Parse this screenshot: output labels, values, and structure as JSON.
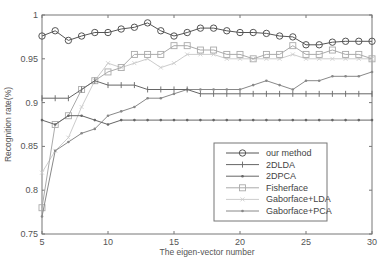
{
  "chart_data": {
    "type": "line",
    "title": "",
    "xlabel": "The eigen-vector number",
    "ylabel": "Recognition rate(%)",
    "xlim": [
      5,
      30
    ],
    "ylim": [
      0.75,
      1.0
    ],
    "xticks": [
      5,
      10,
      15,
      20,
      25,
      30
    ],
    "yticks": [
      0.75,
      0.8,
      0.85,
      0.9,
      0.95,
      1
    ],
    "ytick_labels": [
      "0.75",
      "0.8",
      "0.85",
      "0.9",
      "0.95",
      "1"
    ],
    "xtick_labels": [
      "5",
      "10",
      "15",
      "20",
      "25",
      "30"
    ],
    "grid": false,
    "legend_position": "lower right",
    "x": [
      5,
      6,
      7,
      8,
      9,
      10,
      11,
      12,
      13,
      14,
      15,
      16,
      17,
      18,
      19,
      20,
      21,
      22,
      23,
      24,
      25,
      26,
      27,
      28,
      29,
      30
    ],
    "series": [
      {
        "name": "our method",
        "marker": "circle",
        "color": "#555555",
        "values": [
          0.976,
          0.982,
          0.971,
          0.976,
          0.98,
          0.98,
          0.984,
          0.986,
          0.991,
          0.982,
          0.976,
          0.98,
          0.985,
          0.985,
          0.982,
          0.98,
          0.98,
          0.979,
          0.976,
          0.975,
          0.966,
          0.966,
          0.969,
          0.97,
          0.97,
          0.97
        ]
      },
      {
        "name": "2DLDA",
        "marker": "plus",
        "color": "#666666",
        "values": [
          0.905,
          0.905,
          0.905,
          0.915,
          0.925,
          0.92,
          0.92,
          0.92,
          0.915,
          0.915,
          0.915,
          0.915,
          0.91,
          0.91,
          0.91,
          0.91,
          0.91,
          0.91,
          0.91,
          0.91,
          0.91,
          0.91,
          0.91,
          0.91,
          0.91,
          0.91
        ]
      },
      {
        "name": "2DPCA",
        "marker": "dot",
        "color": "#666666",
        "values": [
          0.88,
          0.875,
          0.885,
          0.885,
          0.88,
          0.875,
          0.88,
          0.88,
          0.88,
          0.88,
          0.88,
          0.88,
          0.88,
          0.88,
          0.88,
          0.88,
          0.88,
          0.88,
          0.88,
          0.88,
          0.88,
          0.88,
          0.88,
          0.88,
          0.88,
          0.88
        ]
      },
      {
        "name": "Fisherface",
        "marker": "square",
        "color": "#aaaaaa",
        "values": [
          0.78,
          0.875,
          0.885,
          0.915,
          0.925,
          0.935,
          0.94,
          0.955,
          0.955,
          0.955,
          0.965,
          0.965,
          0.96,
          0.96,
          0.955,
          0.955,
          0.95,
          0.955,
          0.955,
          0.965,
          0.955,
          0.955,
          0.96,
          0.955,
          0.955,
          0.95
        ]
      },
      {
        "name": "Gaborface+LDA",
        "marker": "x",
        "color": "#cccccc",
        "values": [
          0.82,
          0.845,
          0.86,
          0.895,
          0.925,
          0.945,
          0.94,
          0.945,
          0.95,
          0.94,
          0.945,
          0.955,
          0.955,
          0.955,
          0.95,
          0.95,
          0.95,
          0.95,
          0.95,
          0.955,
          0.95,
          0.95,
          0.95,
          0.95,
          0.95,
          0.95
        ]
      },
      {
        "name": "Gaborface+PCA",
        "marker": "dot",
        "color": "#888888",
        "values": [
          0.77,
          0.845,
          0.855,
          0.865,
          0.87,
          0.885,
          0.89,
          0.895,
          0.905,
          0.905,
          0.91,
          0.915,
          0.915,
          0.915,
          0.915,
          0.915,
          0.92,
          0.925,
          0.92,
          0.915,
          0.925,
          0.925,
          0.93,
          0.93,
          0.93,
          0.935
        ]
      }
    ]
  },
  "legend": {
    "items": [
      "our method",
      "2DLDA",
      "2DPCA",
      "Fisherface",
      "Gaborface+LDA",
      "Gaborface+PCA"
    ]
  },
  "axes": {
    "xlabel": "The eigen-vector number",
    "ylabel": "Recognition rate(%)"
  }
}
